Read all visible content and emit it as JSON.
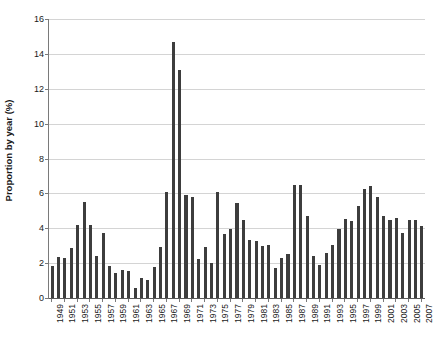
{
  "chart_data": {
    "type": "bar",
    "title": "",
    "xlabel": "",
    "ylabel": "Proportion by year (%)",
    "ylim": [
      0,
      16
    ],
    "ytick_step": 2,
    "yticks": [
      0,
      2,
      4,
      6,
      8,
      10,
      12,
      14,
      16
    ],
    "grid": true,
    "grid_axis": "y",
    "legend": "none",
    "bar_color": "#3d3d3d",
    "gridline_color": "#d4d4d4",
    "axis_color": "#7a7a7a",
    "xtick_label_rotation": -90,
    "xtick_label_every": 2,
    "categories": [
      "1949",
      "1950",
      "1951",
      "1952",
      "1953",
      "1954",
      "1955",
      "1956",
      "1957",
      "1958",
      "1959",
      "1960",
      "1961",
      "1962",
      "1963",
      "1964",
      "1965",
      "1966",
      "1967",
      "1968",
      "1969",
      "1970",
      "1971",
      "1972",
      "1973",
      "1974",
      "1975",
      "1976",
      "1977",
      "1978",
      "1979",
      "1980",
      "1981",
      "1982",
      "1983",
      "1984",
      "1985",
      "1986",
      "1987",
      "1988",
      "1989",
      "1990",
      "1991",
      "1992",
      "1993",
      "1994",
      "1995",
      "1996",
      "1997",
      "1998",
      "1999",
      "2000",
      "2001",
      "2002",
      "2003",
      "2004",
      "2005",
      "2006",
      "2007"
    ],
    "values": [
      1.85,
      2.35,
      2.3,
      2.85,
      4.2,
      5.5,
      4.2,
      2.4,
      3.75,
      1.85,
      1.45,
      1.6,
      1.55,
      0.6,
      1.15,
      1.05,
      1.8,
      2.95,
      6.1,
      14.7,
      13.1,
      5.9,
      5.8,
      2.25,
      2.9,
      2.0,
      6.1,
      3.65,
      3.95,
      5.45,
      4.45,
      3.3,
      3.25,
      3.0,
      3.05,
      1.7,
      2.3,
      2.55,
      6.5,
      6.5,
      4.7,
      2.4,
      1.9,
      2.6,
      3.05,
      3.95,
      4.55,
      4.4,
      5.25,
      6.25,
      6.45,
      5.8,
      4.7,
      4.45,
      4.6,
      3.75,
      4.5,
      4.5,
      4.15
    ]
  }
}
